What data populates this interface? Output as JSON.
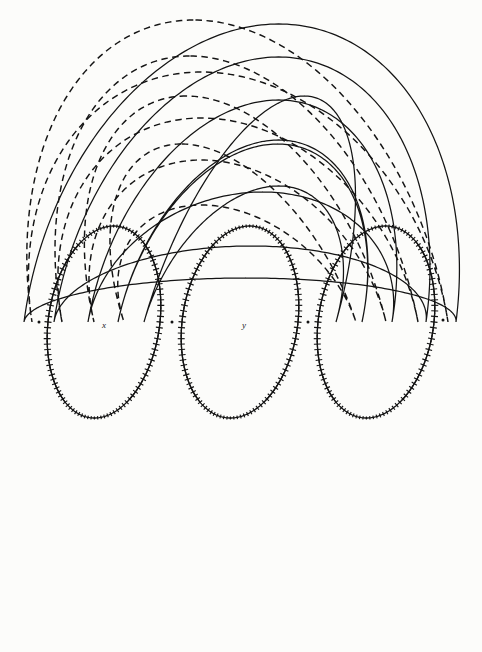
{
  "figure": {
    "background_color": "#fcfcfa",
    "ink_color": "#141414",
    "width": 482,
    "height": 652
  },
  "labels": [
    {
      "name": "pole-label-x",
      "text": "x",
      "cx": 104,
      "cy": 325
    },
    {
      "name": "pole-label-y",
      "text": "y",
      "cx": 244,
      "cy": 325
    }
  ],
  "chart_data": {
    "type": "line",
    "xlabel": "",
    "ylabel": "",
    "grid": false,
    "legend": [
      {
        "key": "solid",
        "label": "lines of force",
        "style": "solid"
      },
      {
        "key": "dashed",
        "label": "equipotential surfaces",
        "style": "dashed"
      },
      {
        "key": "crossed",
        "label": "separatrix (marked with crosses)",
        "style": "cross-marked"
      }
    ],
    "poles": [
      {
        "name": "x",
        "x": 104,
        "y": 325,
        "strength": 1
      },
      {
        "name": "y",
        "x": 244,
        "y": 325,
        "strength": 1
      },
      {
        "name": "",
        "x": 378,
        "y": 325,
        "strength": 1
      }
    ],
    "nodes": [
      {
        "x": 39,
        "y": 322
      },
      {
        "x": 172,
        "y": 322
      },
      {
        "x": 308,
        "y": 322
      },
      {
        "x": 443,
        "y": 320
      }
    ],
    "series": [
      {
        "name": "force-arc-1",
        "style": "solid",
        "pivot_x": 240,
        "top_y": 24,
        "half_width": 216,
        "bottom_y": 366,
        "skew": 92
      },
      {
        "name": "force-arc-2",
        "style": "solid",
        "pivot_x": 240,
        "top_y": 57,
        "half_width": 186,
        "bottom_y": 398,
        "skew": 92
      },
      {
        "name": "force-arc-3",
        "style": "solid",
        "pivot_x": 240,
        "top_y": 100,
        "half_width": 152,
        "bottom_y": 452,
        "skew": 92
      },
      {
        "name": "force-arc-4",
        "style": "solid",
        "pivot_x": 240,
        "top_y": 140,
        "half_width": 122,
        "bottom_y": 500,
        "skew": 92
      },
      {
        "name": "force-arc-5",
        "style": "solid",
        "pivot_x": 240,
        "top_y": 186,
        "half_width": 96,
        "bottom_y": 548,
        "skew": 92
      },
      {
        "name": "equipot-arc-1",
        "style": "dashed",
        "pivot_x": 240,
        "top_y": 72,
        "half_width": 208,
        "bottom_y": 624,
        "skew": -92
      },
      {
        "name": "equipot-arc-2",
        "style": "dashed",
        "pivot_x": 240,
        "top_y": 118,
        "half_width": 178,
        "bottom_y": 588,
        "skew": -92
      },
      {
        "name": "equipot-arc-3",
        "style": "dashed",
        "pivot_x": 240,
        "top_y": 160,
        "half_width": 146,
        "bottom_y": 548,
        "skew": -92
      },
      {
        "name": "equipot-arc-4",
        "style": "dashed",
        "pivot_x": 240,
        "top_y": 205,
        "half_width": 116,
        "bottom_y": 500,
        "skew": -92
      },
      {
        "name": "separatrix-oval-x",
        "style": "cross-marked",
        "cx": 104,
        "cy": 322,
        "rx": 56,
        "ry": 96
      },
      {
        "name": "separatrix-oval-y",
        "style": "cross-marked",
        "cx": 240,
        "cy": 322,
        "rx": 58,
        "ry": 96
      },
      {
        "name": "separatrix-oval-z",
        "style": "cross-marked",
        "cx": 376,
        "cy": 322,
        "rx": 58,
        "ry": 96
      }
    ]
  }
}
